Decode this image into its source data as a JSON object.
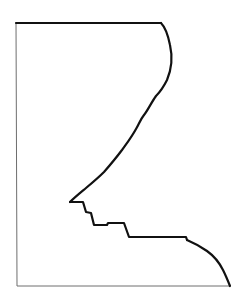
{
  "figure": {
    "colors": {
      "background": "#ffffff",
      "profile_stroke": "#111111",
      "frame_stroke": "#6e6e6e"
    }
  }
}
